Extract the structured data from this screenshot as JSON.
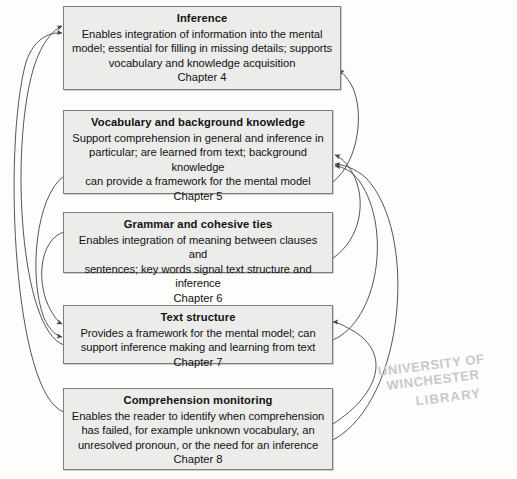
{
  "page": {
    "kind": "flow-diagram",
    "background_color": "#fdfdfc",
    "box_fill_color": "#ececeb",
    "box_border_color": "#7d7d7d",
    "arrow_color": "#4a4a4a",
    "text_color": "#121212"
  },
  "watermark": {
    "line1": "UNIVERSITY OF WINCHESTER",
    "line2": "LIBRARY",
    "color": "#c9c9c9"
  },
  "nodes": [
    {
      "id": "inference",
      "title": "Inference",
      "lines": [
        "Enables integration of information into the mental",
        "model; essential for filling in missing details; supports",
        "vocabulary and knowledge acquisition"
      ],
      "chapter": "Chapter 4"
    },
    {
      "id": "vocabulary-background-knowledge",
      "title": "Vocabulary and background knowledge",
      "lines": [
        "Support comprehension in general and inference in",
        "particular; are learned from text; background knowledge",
        "can provide a framework for the mental model"
      ],
      "chapter": "Chapter 5"
    },
    {
      "id": "grammar-cohesive-ties",
      "title": "Grammar and cohesive ties",
      "lines": [
        "Enables integration of meaning between clauses and",
        "sentences; key words signal text structure and inference"
      ],
      "chapter": "Chapter 6"
    },
    {
      "id": "text-structure",
      "title": "Text structure",
      "lines": [
        "Provides a framework for the mental model; can",
        "support inference making and learning from text"
      ],
      "chapter": "Chapter 7"
    },
    {
      "id": "comprehension-monitoring",
      "title": "Comprehension monitoring",
      "lines": [
        "Enables the reader to identify when comprehension",
        "has failed, for example unknown vocabulary, an",
        "unresolved pronoun, or the need for an inference"
      ],
      "chapter": "Chapter 8"
    }
  ]
}
